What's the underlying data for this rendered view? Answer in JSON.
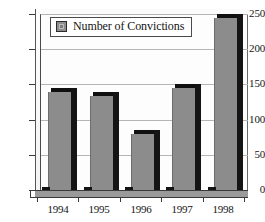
{
  "chart_data": {
    "type": "bar",
    "title": "",
    "subtitle": "",
    "xlabel": "",
    "ylabel": "",
    "categories": [
      "1994",
      "1995",
      "1996",
      "1997",
      "1998"
    ],
    "series": [
      {
        "name": "Number of Convictions",
        "values": [
          139,
          133,
          80,
          145,
          245
        ],
        "color": "#8c8c8c"
      }
    ],
    "ylim": [
      0,
      250
    ],
    "y_ticks": [
      0,
      50,
      100,
      150,
      200,
      250
    ],
    "y_tick_labels": [
      "0",
      "50",
      "100",
      "150",
      "200",
      "250"
    ],
    "grid": true,
    "grid_axis": "y",
    "legend": {
      "position": "top-left-inside",
      "entries": [
        {
          "label": "Number of Convictions",
          "swatch_color": "#8c8c8c"
        }
      ]
    },
    "style": {
      "three_d": true,
      "background": "#ffffff",
      "plot_background": "#fdfdfd",
      "axis_color": "#3a3a3a",
      "gridline_color": "#b5b5b5",
      "bar_face": "#8c8c8c",
      "bar_shadow": "#141414"
    }
  }
}
